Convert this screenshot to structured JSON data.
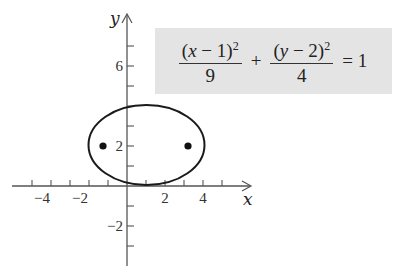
{
  "diagram": {
    "x_axis_label": "x",
    "y_axis_label": "y",
    "x_tick_labels": [
      {
        "value": -4,
        "text": "−4"
      },
      {
        "value": -2,
        "text": "−2"
      },
      {
        "value": 2,
        "text": "2"
      },
      {
        "value": 4,
        "text": "4"
      }
    ],
    "y_tick_labels": [
      {
        "value": 6,
        "text": "6"
      },
      {
        "value": 2,
        "text": "2"
      },
      {
        "value": -2,
        "text": "−2"
      }
    ],
    "equation": {
      "term1_numerator": "(x − 1)",
      "term1_exponent": "2",
      "term1_denominator": "9",
      "plus": "+",
      "term2_numerator": "(y − 2)",
      "term2_exponent": "2",
      "term2_denominator": "4",
      "equals": "= 1"
    },
    "ellipse": {
      "center": [
        1,
        2
      ],
      "a": 3,
      "b": 2
    },
    "foci": [
      [
        -1.236,
        2
      ],
      [
        3.236,
        2
      ]
    ],
    "colors": {
      "curve": "#1a1a1a",
      "axis": "#555555",
      "equation_box": "#e4e4e4"
    }
  }
}
